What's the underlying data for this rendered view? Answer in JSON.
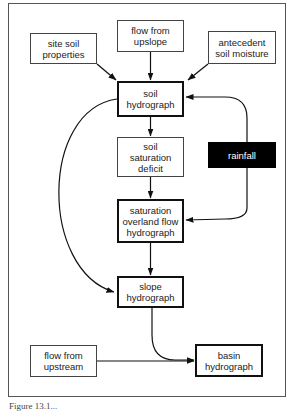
{
  "diagram": {
    "nodes": {
      "site_soil": "site soil\nproperties",
      "flow_upslope": "flow from\nupslope",
      "antecedent": "antecedent\nsoil moisture",
      "soil_hydrograph": "soil\nhydrograph",
      "saturation_deficit": "soil\nsaturation\ndeficit",
      "rainfall": "rainfall",
      "overland_flow": "saturation\noverland flow\nhydrograph",
      "slope_hydrograph": "slope\nhydrograph",
      "flow_upstream": "flow from\nupstream",
      "basin_hydrograph": "basin\nhydrograph"
    },
    "edges": [
      [
        "site_soil",
        "soil_hydrograph"
      ],
      [
        "flow_upslope",
        "soil_hydrograph"
      ],
      [
        "antecedent",
        "soil_hydrograph"
      ],
      [
        "soil_hydrograph",
        "saturation_deficit"
      ],
      [
        "saturation_deficit",
        "overland_flow"
      ],
      [
        "rainfall",
        "soil_hydrograph"
      ],
      [
        "rainfall",
        "overland_flow"
      ],
      [
        "soil_hydrograph",
        "slope_hydrograph"
      ],
      [
        "overland_flow",
        "slope_hydrograph"
      ],
      [
        "slope_hydrograph",
        "basin_hydrograph"
      ],
      [
        "flow_upstream",
        "basin_hydrograph"
      ]
    ],
    "caption": "Figure 13.1..."
  }
}
